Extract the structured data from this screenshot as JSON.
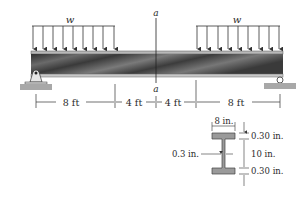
{
  "figure": {
    "type": "simply-supported beam with two distributed loads",
    "load_left": {
      "label": "w"
    },
    "load_right": {
      "label": "w"
    },
    "section_marker": {
      "top_label": "a",
      "bottom_label": "a"
    },
    "dimensions": [
      {
        "label": "8 ft"
      },
      {
        "label": "4 ft"
      },
      {
        "label": "4 ft"
      },
      {
        "label": "8 ft"
      }
    ],
    "supports": {
      "left": "pin-support",
      "right": "roller-support"
    }
  },
  "cross_section": {
    "shape": "wide-flange I-beam",
    "flange_width": "8 in.",
    "top_flange_thickness": "0.30 in.",
    "web_height": "10 in.",
    "bottom_flange_thickness": "0.30 in.",
    "web_thickness": "0.3 in."
  },
  "colors": {
    "beam_dark": "#3a3a3a",
    "beam_light": "#9a9a9a",
    "ground": "#a8a8a8",
    "line": "#333333"
  }
}
